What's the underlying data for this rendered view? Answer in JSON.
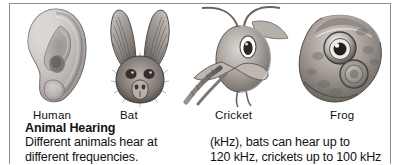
{
  "panel": {
    "heading": "Animal Hearing",
    "border_color": "#8e8e8e",
    "background_color": "#ffffff",
    "text_color": "#111111"
  },
  "illustrations": [
    {
      "key": "human-ear",
      "icon": "human-ear-illustration",
      "label": "Human"
    },
    {
      "key": "bat-head",
      "icon": "bat-head-illustration",
      "label": "Bat"
    },
    {
      "key": "cricket-head",
      "icon": "cricket-head-illustration",
      "label": "Cricket"
    },
    {
      "key": "frog-head",
      "icon": "frog-head-illustration",
      "label": "Frog"
    }
  ],
  "labels": {
    "human": "Human",
    "bat": "Bat",
    "cricket": "Cricket",
    "frog": "Frog"
  },
  "body": {
    "left_column": [
      "Different animals hear at",
      "different frequencies."
    ],
    "right_column": [
      "(kHz), bats can hear up to",
      "120 kHz, crickets up to 100 kHz"
    ]
  }
}
